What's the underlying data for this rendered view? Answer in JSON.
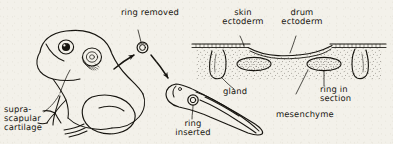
{
  "figure": {
    "background_color": "#f3f1ea",
    "ink_color": "#16140f",
    "style": "hand-drawn pen-and-ink biological illustration"
  },
  "labels": {
    "ring_removed": "ring removed",
    "ring_inserted": "ring\ninserted",
    "supra_scapular_cartilage": "supra-\nscapular\ncartilage",
    "skin_ectoderm": "skin\nectoderm",
    "drum_ectoderm": "drum\nectoderm",
    "gland": "gland",
    "ring_in_section": "ring in\nsection",
    "mesenchyme": "mesenchyme"
  },
  "specimens": {
    "frog": "adult frog, lateral view, showing eye and hatched tympanum",
    "tadpole": "tadpole, lateral view, with ring implanted in tail",
    "ring": "small annular cartilage ring, double circle",
    "section": "histological cross-section through skin and drum"
  },
  "arrows": [
    {
      "name": "frog-to-ring",
      "from": "frog tympanum",
      "to": "removed ring"
    },
    {
      "name": "ring-to-tadpole",
      "from": "removed ring",
      "to": "tadpole"
    }
  ]
}
